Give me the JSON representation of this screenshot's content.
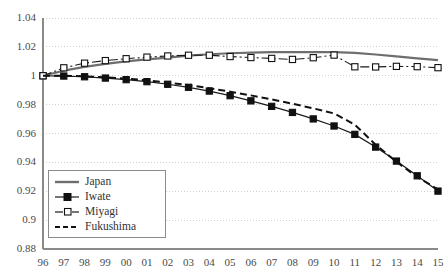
{
  "chart_data": {
    "type": "line",
    "title": "",
    "subtitle": "",
    "xlabel": "",
    "ylabel": "",
    "grid": "horizontal-dotted",
    "legend_position": "inside-bottom-left",
    "xlim": [
      1996,
      2015
    ],
    "ylim": [
      0.88,
      1.04
    ],
    "ytick_step": 0.02,
    "x": [
      1996,
      1997,
      1998,
      1999,
      2000,
      2001,
      2002,
      2003,
      2004,
      2005,
      2006,
      2007,
      2008,
      2009,
      2010,
      2011,
      2012,
      2013,
      2014,
      2015
    ],
    "categories": [
      "96",
      "97",
      "98",
      "99",
      "00",
      "01",
      "02",
      "03",
      "04",
      "05",
      "06",
      "07",
      "08",
      "09",
      "10",
      "11",
      "12",
      "13",
      "14",
      "15"
    ],
    "ytick_labels": [
      "1.04",
      "1.02",
      "1",
      "0.98",
      "0.96",
      "0.94",
      "0.92",
      "0.9",
      "0.88"
    ],
    "ytick_values": [
      1.04,
      1.02,
      1.0,
      0.98,
      0.96,
      0.94,
      0.92,
      0.9,
      0.88
    ],
    "series": [
      {
        "name": "Japan",
        "color": "#6e6e6e",
        "style": "solid",
        "marker": "none",
        "width": 2.2,
        "values": [
          1.0,
          1.0035,
          1.0062,
          1.0082,
          1.0099,
          1.0113,
          1.0126,
          1.0139,
          1.0149,
          1.0156,
          1.016,
          1.0163,
          1.0164,
          1.0164,
          1.0164,
          1.0158,
          1.0147,
          1.0134,
          1.0121,
          1.0108
        ]
      },
      {
        "name": "Iwate",
        "color": "#1a1a1a",
        "style": "solid",
        "marker": "filled-square",
        "width": 1.2,
        "values": [
          1.0,
          0.9998,
          0.9993,
          0.9984,
          0.9973,
          0.9959,
          0.9941,
          0.992,
          0.9894,
          0.9862,
          0.9826,
          0.9788,
          0.9746,
          0.9701,
          0.9652,
          0.9594,
          0.9506,
          0.9409,
          0.9307,
          0.9201
        ]
      },
      {
        "name": "Miyagi",
        "color": "#1a1a1a",
        "style": "dashdot",
        "marker": "open-square",
        "width": 1.1,
        "values": [
          1.0,
          1.0055,
          1.0087,
          1.0105,
          1.0118,
          1.0129,
          1.0137,
          1.0142,
          1.0142,
          1.0133,
          1.0126,
          1.012,
          1.0113,
          1.0125,
          1.0143,
          1.0062,
          1.0061,
          1.0065,
          1.0063,
          1.0056
        ]
      },
      {
        "name": "Fukushima",
        "color": "#111111",
        "style": "dashed",
        "marker": "none",
        "width": 2.0,
        "values": [
          1.0,
          1.0,
          0.9996,
          0.9989,
          0.998,
          0.9968,
          0.9953,
          0.9935,
          0.9914,
          0.989,
          0.9864,
          0.9836,
          0.9806,
          0.9774,
          0.9739,
          0.9661,
          0.9523,
          0.9404,
          0.9299,
          0.9213
        ]
      }
    ]
  },
  "legend": {
    "items": [
      {
        "label": "Japan",
        "swatch": "solid-gray-line"
      },
      {
        "label": "Iwate",
        "swatch": "line-with-filled-square"
      },
      {
        "label": "Miyagi",
        "swatch": "line-with-open-square"
      },
      {
        "label": "Fukushima",
        "swatch": "dashed-black-line"
      }
    ]
  },
  "axes": {
    "y_axis_color": "#8a8a8a",
    "x_axis_color": "#8a8a8a",
    "gridline_color": "#cfcfcf"
  }
}
